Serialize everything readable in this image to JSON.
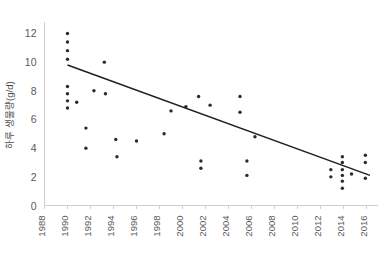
{
  "chart_data": {
    "type": "scatter",
    "title": "",
    "xlabel": "",
    "ylabel": "하루 생물량(g/d)",
    "xlim": [
      1988,
      2017
    ],
    "ylim": [
      0,
      12.8
    ],
    "grid": false,
    "legend": false,
    "xticks": [
      1988,
      1990,
      1992,
      1994,
      1996,
      1998,
      2000,
      2002,
      2004,
      2006,
      2008,
      2010,
      2012,
      2014,
      2016
    ],
    "xtick_labels": [
      "1988",
      "1990",
      "1992",
      "1994",
      "1996",
      "1998",
      "2000",
      "2002",
      "2004",
      "2006",
      "2008",
      "2010",
      "2012",
      "2014",
      "2016"
    ],
    "yticks": [
      0,
      2,
      4,
      6,
      8,
      10,
      12
    ],
    "ytick_labels": [
      "0",
      "2",
      "4",
      "6",
      "8",
      "10",
      "12"
    ],
    "point_color": "#2b2b2b",
    "line_color": "#1f1f1f",
    "axis_color": "#d0d0d0",
    "tick_label_color": "#595959",
    "points": [
      {
        "x": 1990.0,
        "y": 12.0
      },
      {
        "x": 1990.0,
        "y": 11.4
      },
      {
        "x": 1990.0,
        "y": 10.8
      },
      {
        "x": 1990.0,
        "y": 10.2
      },
      {
        "x": 1990.0,
        "y": 8.3
      },
      {
        "x": 1990.0,
        "y": 7.8
      },
      {
        "x": 1990.0,
        "y": 7.3
      },
      {
        "x": 1990.0,
        "y": 6.8
      },
      {
        "x": 1990.8,
        "y": 7.2
      },
      {
        "x": 1993.2,
        "y": 10.0
      },
      {
        "x": 1992.3,
        "y": 8.0
      },
      {
        "x": 1993.3,
        "y": 7.8
      },
      {
        "x": 1991.6,
        "y": 5.4
      },
      {
        "x": 1991.6,
        "y": 4.0
      },
      {
        "x": 1994.2,
        "y": 4.6
      },
      {
        "x": 1996.0,
        "y": 4.5
      },
      {
        "x": 1994.3,
        "y": 3.4
      },
      {
        "x": 1999.0,
        "y": 6.6
      },
      {
        "x": 1998.4,
        "y": 5.0
      },
      {
        "x": 2000.3,
        "y": 6.9
      },
      {
        "x": 2001.4,
        "y": 7.6
      },
      {
        "x": 2002.4,
        "y": 7.0
      },
      {
        "x": 2005.0,
        "y": 7.6
      },
      {
        "x": 2005.0,
        "y": 6.5
      },
      {
        "x": 2006.3,
        "y": 4.8
      },
      {
        "x": 2001.6,
        "y": 3.1
      },
      {
        "x": 2001.6,
        "y": 2.6
      },
      {
        "x": 2005.6,
        "y": 3.1
      },
      {
        "x": 2005.6,
        "y": 2.1
      },
      {
        "x": 2012.9,
        "y": 2.5
      },
      {
        "x": 2012.9,
        "y": 2.0
      },
      {
        "x": 2013.9,
        "y": 3.4
      },
      {
        "x": 2013.9,
        "y": 3.0
      },
      {
        "x": 2013.9,
        "y": 2.5
      },
      {
        "x": 2013.9,
        "y": 2.1
      },
      {
        "x": 2013.9,
        "y": 1.7
      },
      {
        "x": 2013.9,
        "y": 1.2
      },
      {
        "x": 2014.7,
        "y": 2.2
      },
      {
        "x": 2015.9,
        "y": 3.5
      },
      {
        "x": 2015.9,
        "y": 3.0
      },
      {
        "x": 2015.9,
        "y": 1.9
      }
    ],
    "trendline": {
      "x_start": 1990.0,
      "y_start": 9.8,
      "x_end": 2016.3,
      "y_end": 2.1
    }
  }
}
